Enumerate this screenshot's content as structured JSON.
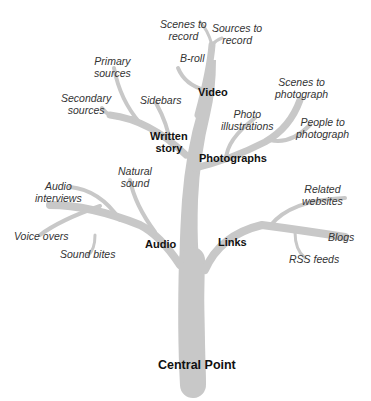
{
  "diagram": {
    "root": "Central Point",
    "colors": {
      "branch": "#c8c8c8",
      "main_text": "#111111",
      "leaf_text": "#333333"
    },
    "branches": {
      "video": {
        "label": "Video",
        "leaves": {
          "scenes": "Scenes to\nrecord",
          "sources": "Sources to\nrecord",
          "broll": "B-roll"
        }
      },
      "written": {
        "label": "Written\nstory",
        "leaves": {
          "primary": "Primary\nsources",
          "secondary": "Secondary\nsources",
          "sidebars": "Sidebars"
        }
      },
      "photographs": {
        "label": "Photographs",
        "leaves": {
          "scenes": "Scenes to\nphotograph",
          "illustrations": "Photo\nillustrations",
          "people": "People to\nphotograph"
        }
      },
      "audio": {
        "label": "Audio",
        "leaves": {
          "natural": "Natural\nsound",
          "interviews": "Audio\ninterviews",
          "voice": "Voice overs",
          "bites": "Sound bites"
        }
      },
      "links": {
        "label": "Links",
        "leaves": {
          "related": "Related\nwebsites",
          "blogs": "Blogs",
          "rss": "RSS feeds"
        }
      }
    }
  }
}
